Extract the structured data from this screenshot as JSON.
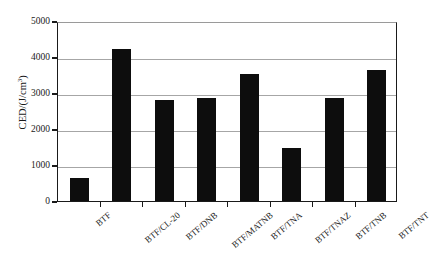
{
  "chart_data": {
    "type": "bar",
    "title": "",
    "xlabel": "",
    "ylabel": "CED/(J/cm3)",
    "ylabel_base": "CED/(J/cm",
    "ylabel_exponent": "3",
    "ylabel_close": ")",
    "ylim": [
      0,
      5000
    ],
    "ytick_labels": [
      "5000",
      "4000",
      "3000",
      "2000",
      "1000",
      "0"
    ],
    "ytick_values": [
      5000,
      4000,
      3000,
      2000,
      1000,
      0
    ],
    "grid": true,
    "grid_axis": "y",
    "legend": "none",
    "bar_color": "#0d0d0d",
    "axis_color": "#1a1a1a",
    "grid_color": "#a6a6a6",
    "categories": [
      "BTF",
      "BTF/CL-20",
      "BTF/DNB",
      "BTF/MATNB",
      "BTF/TNA",
      "BTF/TNAZ",
      "BTF/TNB",
      "BTF/TNT"
    ],
    "values": [
      640,
      4230,
      2800,
      2870,
      3540,
      1460,
      2850,
      3650
    ]
  }
}
